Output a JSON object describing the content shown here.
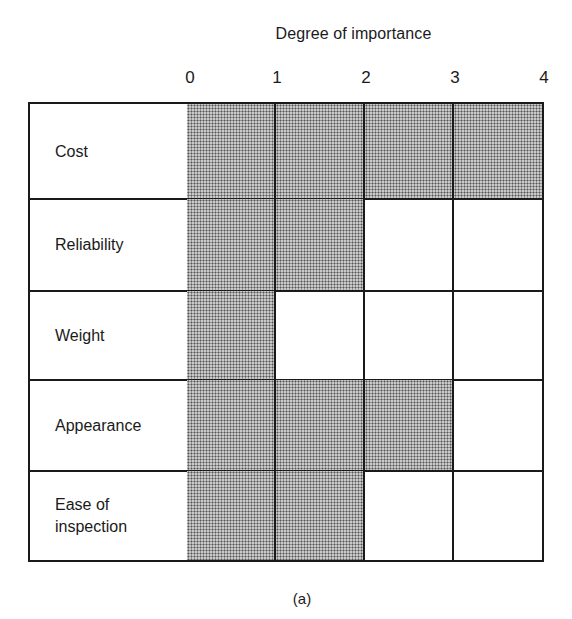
{
  "chart_data": {
    "type": "bar",
    "orientation": "horizontal",
    "title": "Degree of importance",
    "xlabel": "Degree of importance",
    "ylabel": "",
    "x_ticks": [
      "0",
      "1",
      "2",
      "3",
      "4"
    ],
    "xlim": [
      0,
      4
    ],
    "grid": true,
    "categories": [
      "Cost",
      "Reliability",
      "Weight",
      "Appearance",
      "Ease of inspection"
    ],
    "values": [
      4,
      2,
      1,
      3,
      2
    ],
    "caption": "(a)",
    "fill": "halftone grey dots"
  },
  "chart": {
    "title": "Degree of importance",
    "ticks": [
      "0",
      "1",
      "2",
      "3",
      "4"
    ],
    "rows": [
      {
        "label": "Cost",
        "value": 4
      },
      {
        "label": "Reliability",
        "value": 2
      },
      {
        "label": "Weight",
        "value": 1
      },
      {
        "label": "Appearance",
        "value": 3
      },
      {
        "label": "Ease of\ninspection",
        "value": 2
      }
    ],
    "caption": "(a)"
  }
}
